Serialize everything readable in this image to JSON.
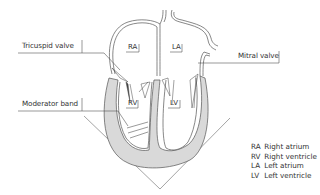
{
  "diagram": {
    "type": "anatomical-heart-cross-section",
    "callouts": [
      {
        "id": "tricuspid",
        "label": "Tricuspid valve"
      },
      {
        "id": "mitral",
        "label": "Mitral valve"
      },
      {
        "id": "moderator",
        "label": "Moderator band"
      }
    ],
    "chambers": [
      {
        "abbr": "RA"
      },
      {
        "abbr": "LA"
      },
      {
        "abbr": "RV"
      },
      {
        "abbr": "LV"
      }
    ],
    "legend": [
      {
        "abbr": "RA",
        "text": "Right atrium"
      },
      {
        "abbr": "RV",
        "text": "Right ventricle"
      },
      {
        "abbr": "LA",
        "text": "Left atrium"
      },
      {
        "abbr": "LV",
        "text": "Left ventricle"
      }
    ],
    "colors": {
      "line": "#555555",
      "myocardium_fill": "#d9d9d9",
      "text": "#333333"
    }
  }
}
